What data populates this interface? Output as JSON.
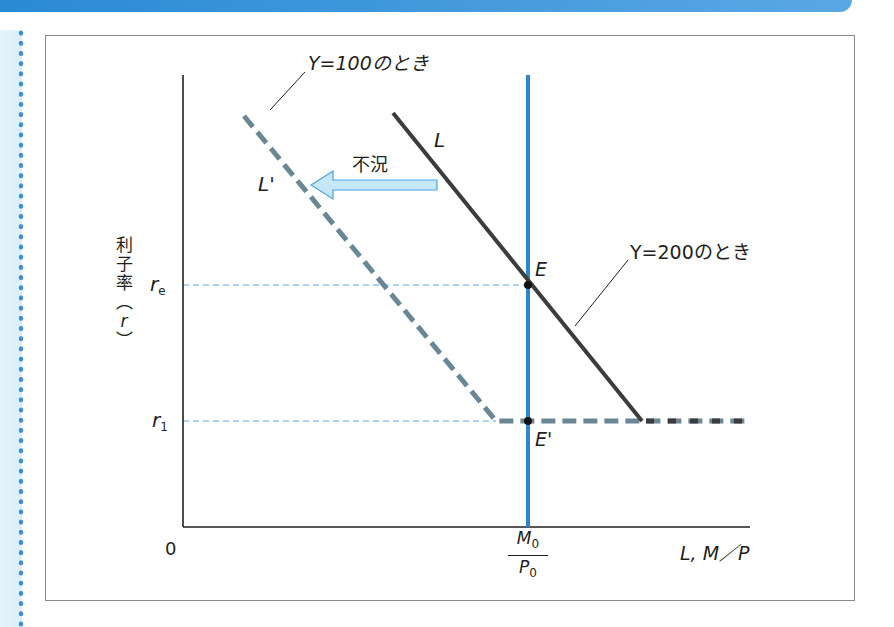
{
  "diagram": {
    "title": "",
    "y_axis_label": "利子率（r）",
    "y_axis_label_chars": [
      "利",
      "子",
      "率",
      "︵",
      "r",
      "︶"
    ],
    "x_axis_label": "L, M／P",
    "origin_label": "0",
    "y_ticks": [
      {
        "label": "r",
        "sub": "e",
        "y": 285
      },
      {
        "label": "r",
        "sub": "1",
        "y": 421
      }
    ],
    "x_tick": {
      "num": "M",
      "num_sub": "0",
      "den": "P",
      "den_sub": "0"
    },
    "curves": {
      "L": {
        "label": "L",
        "annotation": "Y=200のとき",
        "color": "#3c3c3c"
      },
      "L_prime": {
        "label": "L'",
        "annotation": "Y=100のとき",
        "color": "#6a8796"
      },
      "money_supply": {
        "color": "#2b86cf"
      }
    },
    "points": {
      "E": {
        "label": "E"
      },
      "E_prime": {
        "label": "E'"
      }
    },
    "shift_arrow": {
      "label": "不況",
      "direction": "left",
      "color": "#a8d8f0"
    }
  },
  "colors": {
    "accent_blue": "#2b86cf",
    "guide_dash": "#5aa8e4",
    "dot_border": "#3a8fd6"
  }
}
